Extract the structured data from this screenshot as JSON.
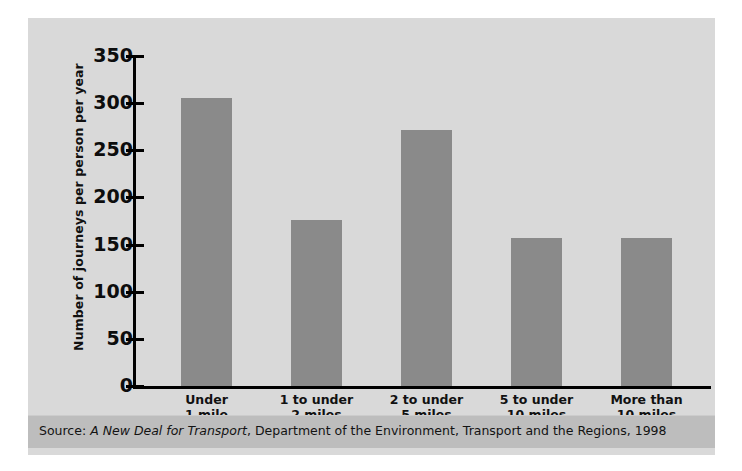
{
  "chart_data": {
    "type": "bar",
    "title": "",
    "xlabel": "",
    "ylabel": "Number of journeys per person per year",
    "categories": [
      "Under 1 mile",
      "1 to under 2 miles",
      "2 to under 5 miles",
      "5 to under 10 miles",
      "More than 10 miles"
    ],
    "category_lines": [
      [
        "Under",
        "1 mile"
      ],
      [
        "1 to under",
        "2 miles"
      ],
      [
        "2 to under",
        "5 miles"
      ],
      [
        "5 to under",
        "10 miles"
      ],
      [
        "More than",
        "10 miles"
      ]
    ],
    "values": [
      305,
      176,
      272,
      157,
      157
    ],
    "ylim": [
      0,
      350
    ],
    "yticks": [
      350,
      300,
      250,
      200,
      150,
      100,
      50,
      0
    ],
    "ytick_labels": [
      "350",
      "300",
      "250",
      "200",
      "150",
      "100",
      "50",
      "0"
    ],
    "grid": false,
    "legend": "none",
    "bar_color": "#8a8a8a",
    "panel_color": "#d9d9d9",
    "axis_color": "#000000"
  },
  "source": {
    "prefix": "Source: ",
    "italic_title": "A New Deal for Transport",
    "suffix": ", Department of the Environment, Transport and the Regions, 1998",
    "full_text": "Source: A New Deal for Transport, Department of the Environment, Transport and the Regions, 1998",
    "band_color": "#bdbdbd"
  }
}
